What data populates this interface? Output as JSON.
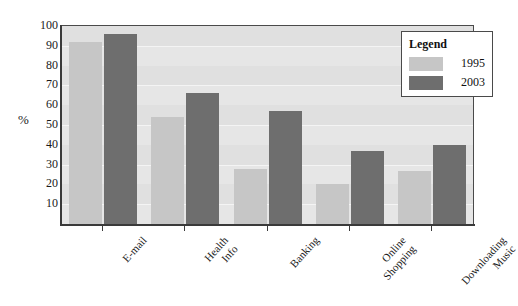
{
  "chart_data": {
    "type": "bar",
    "title": "",
    "xlabel": "",
    "ylabel": "%",
    "ylim": [
      0,
      100
    ],
    "ytick_step": 10,
    "yticks": [
      100,
      90,
      80,
      70,
      60,
      50,
      40,
      30,
      20,
      10
    ],
    "grid": true,
    "legend_position": "top-right",
    "categories": [
      "E-mail",
      "Health Info",
      "Banking",
      "Online Shopping",
      "Downloading Music"
    ],
    "category_lines": [
      [
        "E-mail"
      ],
      [
        "Health",
        "Info"
      ],
      [
        "Banking"
      ],
      [
        "Online",
        "Shopping"
      ],
      [
        "Downloading",
        "Music"
      ]
    ],
    "series": [
      {
        "name": "1995",
        "color": "#c6c6c6",
        "values": [
          92,
          54,
          28,
          20,
          27
        ]
      },
      {
        "name": "2003",
        "color": "#6e6e6e",
        "values": [
          96,
          66,
          57,
          37,
          40
        ]
      }
    ]
  },
  "legend": {
    "title": "Legend",
    "entries": [
      {
        "label": "1995",
        "color": "#c6c6c6"
      },
      {
        "label": "2003",
        "color": "#6e6e6e"
      }
    ]
  },
  "axes": {
    "y_title": "%"
  },
  "colors": {
    "plot_background": "#e6e6e6",
    "band": "#e0e0e0",
    "gridline": "#f4f4f4",
    "axis": "#3a3a3a",
    "page_background": "#ffffff",
    "series_1995": "#c6c6c6",
    "series_2003": "#6e6e6e"
  }
}
